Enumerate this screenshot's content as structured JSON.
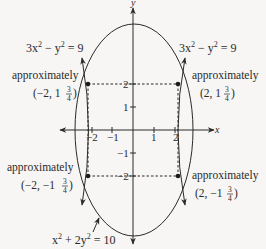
{
  "axes": {
    "x_label": "x",
    "y_label": "y",
    "x_ticks": [
      "−2",
      "−1",
      "1",
      "2"
    ],
    "y_ticks": [
      "2",
      "1",
      "−1",
      "−2"
    ]
  },
  "equations": {
    "hyperbola_left": {
      "base": "3x",
      "exp1": "2",
      "mid": " − y",
      "exp2": "2",
      "tail": " = 9"
    },
    "hyperbola_right": {
      "base": "3x",
      "exp1": "2",
      "mid": " − y",
      "exp2": "2",
      "tail": " = 9"
    },
    "ellipse": {
      "base": "x",
      "exp1": "2",
      "mid": " + 2y",
      "exp2": "2",
      "tail": " = 10"
    }
  },
  "annotations": [
    {
      "word": "approximately",
      "coord_prefix": "(−2, 1",
      "num": "3",
      "den": "4",
      "suffix": ")"
    },
    {
      "word": "approximately",
      "coord_prefix": "(2, 1",
      "num": "3",
      "den": "4",
      "suffix": ")"
    },
    {
      "word": "approximately",
      "coord_prefix": "(−2, −1",
      "num": "3",
      "den": "4",
      "suffix": ")"
    },
    {
      "word": "approximately",
      "coord_prefix": "(2, −1",
      "num": "3",
      "den": "4",
      "suffix": ")"
    }
  ],
  "intersection_points": [
    {
      "x": -2,
      "y": 1.75
    },
    {
      "x": 2,
      "y": 1.75
    },
    {
      "x": -2,
      "y": -1.75
    },
    {
      "x": 2,
      "y": -1.75
    }
  ],
  "colors": {
    "ink": "#2a2a2a",
    "background": "#f7f6f4"
  }
}
